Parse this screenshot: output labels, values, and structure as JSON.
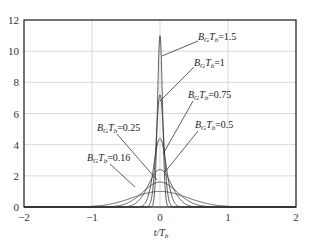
{
  "chart_data": {
    "type": "line",
    "title": "",
    "xlabel": "t/T_b",
    "ylabel": "",
    "xlim": [
      -2,
      2
    ],
    "ylim": [
      0,
      12
    ],
    "grid": true,
    "xticks": [
      -2,
      -1,
      0,
      1,
      2
    ],
    "yticks": [
      0,
      2,
      4,
      6,
      8,
      10,
      12
    ],
    "series": [
      {
        "name": "B_G T_b=1.5",
        "label_text": "=1.5",
        "peak": 11.0,
        "label_pos": [
          198,
          40
        ],
        "leader": [
          [
            198,
            41
          ],
          [
            162,
            56
          ]
        ]
      },
      {
        "name": "B_G T_b=1",
        "label_text": "=1",
        "peak": 7.2,
        "label_pos": [
          194,
          66
        ],
        "leader": [
          [
            194,
            67
          ],
          [
            160,
            101
          ]
        ]
      },
      {
        "name": "B_G T_b=0.75",
        "label_text": "=0.75",
        "peak": 4.4,
        "label_pos": [
          188,
          98
        ],
        "leader": [
          [
            193,
            101
          ],
          [
            163,
            154
          ]
        ]
      },
      {
        "name": "B_G T_b=0.5",
        "label_text": "=0.5",
        "peak": 2.4,
        "label_pos": [
          195,
          128
        ],
        "leader": [
          [
            198,
            131
          ],
          [
            165,
            172
          ]
        ]
      },
      {
        "name": "B_G T_b=0.25",
        "label_text": "=0.25",
        "peak": 1.6,
        "label_pos": [
          97,
          131
        ],
        "leader": [
          [
            117,
            134
          ],
          [
            157,
            180
          ]
        ]
      },
      {
        "name": "B_G T_b=0.16",
        "label_text": "=0.16",
        "peak": 1.0,
        "label_pos": [
          87,
          161
        ],
        "leader": [
          [
            110,
            164
          ],
          [
            135,
            187
          ]
        ]
      }
    ]
  }
}
